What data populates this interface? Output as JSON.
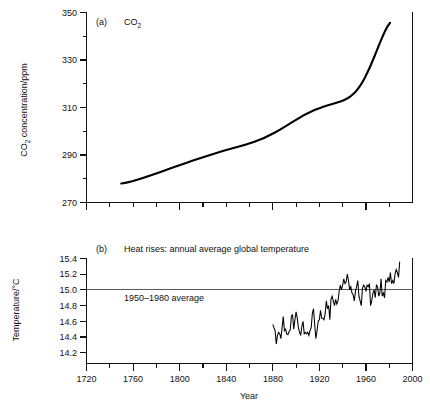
{
  "figure": {
    "xlabel": "Year",
    "background": "#ffffff",
    "ink_color": "#000000"
  },
  "chart_data": [
    {
      "type": "line",
      "panel": "a",
      "panel_label": "(a)",
      "title": "CO₂",
      "xlabel": "",
      "ylabel": "CO₂ concentration/ppm",
      "xlim": [
        1720,
        2000
      ],
      "ylim": [
        270,
        350
      ],
      "xticks": [
        1720,
        1760,
        1800,
        1840,
        1880,
        1920,
        1960,
        2000
      ],
      "xticklabels": [
        "1720",
        "1760",
        "1800",
        "1840",
        "1880",
        "1920",
        "1960",
        "2000"
      ],
      "xminorticks": [
        1740,
        1780,
        1820,
        1860,
        1900,
        1940,
        1980
      ],
      "yticks": [
        270,
        290,
        310,
        330,
        350
      ],
      "yticklabels": [
        "270",
        "290",
        "310",
        "330",
        "350"
      ],
      "yminorticks": [
        280,
        300,
        320,
        340
      ],
      "grid": false,
      "legend": false,
      "x": [
        1750,
        1760,
        1770,
        1780,
        1790,
        1800,
        1810,
        1820,
        1830,
        1840,
        1850,
        1860,
        1870,
        1880,
        1890,
        1900,
        1910,
        1920,
        1930,
        1940,
        1950,
        1955,
        1960,
        1965,
        1970,
        1975,
        1980,
        1985,
        1990
      ],
      "values": [
        278.0,
        278.4,
        278.9,
        279.6,
        280.4,
        281.3,
        282.3,
        283.3,
        284.3,
        285.3,
        286.4,
        287.5,
        288.6,
        289.8,
        291.4,
        295.0,
        299.0,
        302.6,
        306.0,
        308.6,
        311.0,
        312.3,
        314.0,
        318.5,
        324.5,
        330.5,
        337.0,
        343.0,
        346.5
      ],
      "units": "ppm",
      "series_start_year": 1750,
      "series_end_year": 1990
    },
    {
      "type": "line",
      "panel": "b",
      "panel_label": "(b)",
      "title": "Heat rises: annual average global temperature",
      "xlabel": "Year",
      "ylabel": "Temperature/°C",
      "xlim": [
        1720,
        2000
      ],
      "ylim": [
        14.1,
        15.45
      ],
      "xticks": [
        1720,
        1760,
        1800,
        1840,
        1880,
        1920,
        1960,
        2000
      ],
      "xticklabels": [
        "1720",
        "1760",
        "1800",
        "1840",
        "1880",
        "1920",
        "1960",
        "2000"
      ],
      "xminorticks": [
        1740,
        1780,
        1820,
        1860,
        1900,
        1940,
        1980
      ],
      "yticks": [
        14.2,
        14.4,
        14.6,
        14.8,
        15.0,
        15.2,
        15.4
      ],
      "yticklabels": [
        "14.2",
        "14.4",
        "14.6",
        "14.8",
        "15.0",
        "15.2",
        "15.4"
      ],
      "grid": false,
      "legend": false,
      "reference_line": {
        "value": 15.0,
        "label": "1950–1980 average",
        "color": "#5a5a5a"
      },
      "units": "°C",
      "series_start_year": 1880,
      "series_end_year": 1991,
      "x": [
        1880,
        1881,
        1882,
        1883,
        1884,
        1885,
        1886,
        1887,
        1888,
        1889,
        1890,
        1891,
        1892,
        1893,
        1894,
        1895,
        1896,
        1897,
        1898,
        1899,
        1900,
        1901,
        1902,
        1903,
        1904,
        1905,
        1906,
        1907,
        1908,
        1909,
        1910,
        1911,
        1912,
        1913,
        1914,
        1915,
        1916,
        1917,
        1918,
        1919,
        1920,
        1921,
        1922,
        1923,
        1924,
        1925,
        1926,
        1927,
        1928,
        1929,
        1930,
        1931,
        1932,
        1933,
        1934,
        1935,
        1936,
        1937,
        1938,
        1939,
        1940,
        1941,
        1942,
        1943,
        1944,
        1945,
        1946,
        1947,
        1948,
        1949,
        1950,
        1951,
        1952,
        1953,
        1954,
        1955,
        1956,
        1957,
        1958,
        1959,
        1960,
        1961,
        1962,
        1963,
        1964,
        1965,
        1966,
        1967,
        1968,
        1969,
        1970,
        1971,
        1972,
        1973,
        1974,
        1975,
        1976,
        1977,
        1978,
        1979,
        1980,
        1981,
        1982,
        1983,
        1984,
        1985,
        1986,
        1987,
        1988,
        1989,
        1990,
        1991
      ],
      "values": [
        14.56,
        14.52,
        14.48,
        14.31,
        14.42,
        14.46,
        14.44,
        14.38,
        14.52,
        14.66,
        14.48,
        14.5,
        14.44,
        14.43,
        14.47,
        14.49,
        14.67,
        14.68,
        14.5,
        14.62,
        14.72,
        14.64,
        14.52,
        14.46,
        14.42,
        14.54,
        14.6,
        14.44,
        14.46,
        14.44,
        14.46,
        14.42,
        14.48,
        14.52,
        14.7,
        14.76,
        14.56,
        14.38,
        14.48,
        14.6,
        14.62,
        14.74,
        14.64,
        14.64,
        14.62,
        14.7,
        14.86,
        14.76,
        14.8,
        14.62,
        14.88,
        14.92,
        14.86,
        14.8,
        14.88,
        14.82,
        14.86,
        14.98,
        15.06,
        15.0,
        15.06,
        15.14,
        15.08,
        15.1,
        15.2,
        15.12,
        15.0,
        15.04,
        14.96,
        14.94,
        14.86,
        14.98,
        15.04,
        15.12,
        14.92,
        14.86,
        14.8,
        15.02,
        15.06,
        15.04,
        14.98,
        15.06,
        15.04,
        15.08,
        14.8,
        14.86,
        14.96,
        15.0,
        14.9,
        15.06,
        15.04,
        14.92,
        14.96,
        15.14,
        14.92,
        14.96,
        14.9,
        15.12,
        15.1,
        15.16,
        15.1,
        15.22,
        15.08,
        15.12,
        15.08,
        15.2,
        15.26,
        15.22,
        15.16,
        15.36
      ]
    }
  ]
}
